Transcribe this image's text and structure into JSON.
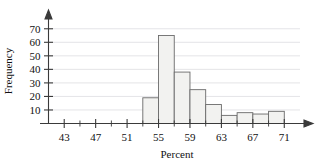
{
  "chart_data": {
    "type": "bar",
    "title": "",
    "subtitle": "",
    "xlabel": "Percent",
    "ylabel": "Frequency",
    "xlim": [
      41,
      73
    ],
    "ylim": [
      0,
      75
    ],
    "grid": true,
    "legend": null,
    "bin_width": 2,
    "x_tick_labels": [
      "43",
      "47",
      "51",
      "55",
      "59",
      "63",
      "67",
      "71"
    ],
    "x_tick_values": [
      43,
      47,
      51,
      55,
      59,
      63,
      67,
      71
    ],
    "x_minor_ticks": [
      45,
      49,
      53,
      57,
      61,
      65,
      69
    ],
    "y_tick_labels": [
      "10",
      "20",
      "30",
      "40",
      "50",
      "60",
      "70"
    ],
    "y_tick_values": [
      10,
      20,
      30,
      40,
      50,
      60,
      70
    ],
    "categories": [
      "53-55",
      "55-57",
      "57-59",
      "59-61",
      "61-63",
      "63-65",
      "65-67",
      "67-69",
      "69-71"
    ],
    "bin_starts": [
      53,
      55,
      57,
      59,
      61,
      63,
      65,
      67,
      69
    ],
    "values": [
      19,
      65,
      38,
      25,
      14,
      6,
      8,
      7,
      9
    ],
    "bar_fill": "#f2f2f0",
    "bar_stroke": "#6a6a6a",
    "gridline_color": "#d9d9dd",
    "axis_color": "#3a3a3a"
  },
  "axes": {
    "y_axis_title": "Frequency",
    "x_axis_title": "Percent"
  }
}
